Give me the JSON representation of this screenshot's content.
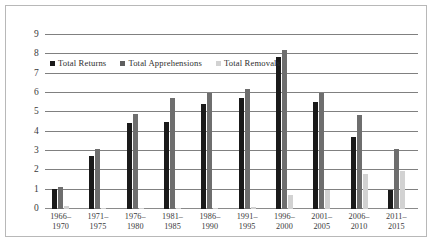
{
  "chart_data": {
    "type": "bar",
    "title": "",
    "subtitle": "",
    "xlabel": "",
    "ylabel": "",
    "ylim": [
      0,
      9
    ],
    "yticks": [
      9,
      8,
      7,
      6,
      5,
      4,
      3,
      2,
      1,
      0
    ],
    "grid": true,
    "legend_position": "upper-left-inside",
    "categories": [
      "1966–1970",
      "1971–1975",
      "1976–1980",
      "1981–1985",
      "1986–1990",
      "1991–1995",
      "1996–2000",
      "2001–2005",
      "2006–2010",
      "2011–2015"
    ],
    "category_lines": [
      [
        "1966–",
        "1970"
      ],
      [
        "1971–",
        "1975"
      ],
      [
        "1976–",
        "1980"
      ],
      [
        "1981–",
        "1985"
      ],
      [
        "1986–",
        "1990"
      ],
      [
        "1991–",
        "1995"
      ],
      [
        "1996–",
        "2000"
      ],
      [
        "2001–",
        "2005"
      ],
      [
        "2006–",
        "2010"
      ],
      [
        "2011–",
        "2015"
      ]
    ],
    "series": [
      {
        "name": "Total Returns",
        "color": "#1a1a1a",
        "values": [
          1.02,
          2.75,
          4.45,
          4.48,
          5.42,
          5.72,
          7.85,
          5.55,
          3.75,
          1.0
        ]
      },
      {
        "name": "Total Apprehensions",
        "color": "#6e6e6e",
        "values": [
          1.12,
          3.1,
          4.92,
          5.75,
          6.02,
          6.2,
          8.2,
          6.02,
          4.85,
          3.1
        ]
      },
      {
        "name": "Total Removals",
        "color": "#d2d2d2",
        "values": [
          0.15,
          0.04,
          0.06,
          0.06,
          0.06,
          0.13,
          0.7,
          0.97,
          1.8,
          1.95
        ]
      }
    ]
  },
  "legend": {
    "items": [
      {
        "label": "Total Returns"
      },
      {
        "label": "Total Apprehensions"
      },
      {
        "label": "Total Removals"
      }
    ]
  }
}
